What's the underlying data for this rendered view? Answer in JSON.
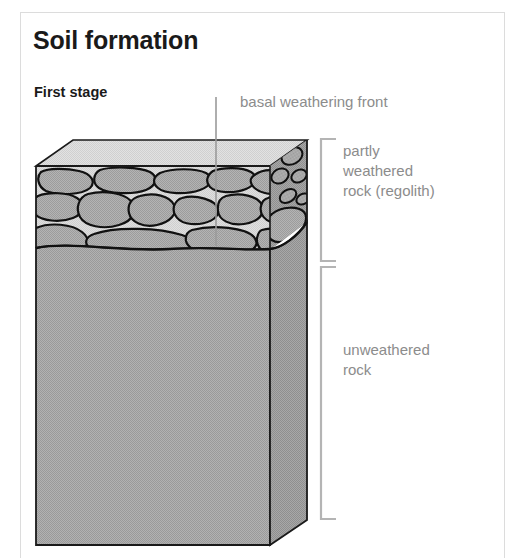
{
  "figure": {
    "title": "Soil formation",
    "subtitle": "First stage",
    "background_color": "#ffffff",
    "border_color": "#dcdcdc"
  },
  "labels": {
    "basal_weathering_front": "basal weathering front",
    "partly_weathered_rock": "partly\nweathered\nrock (regolith)",
    "unweathered_rock": "unweathered\nrock",
    "label_color": "#8c8c8c"
  },
  "diagram": {
    "type": "block-diagram",
    "layers": [
      {
        "name": "partly weathered rock (regolith)",
        "position": "top",
        "fill": "#d4d4d4",
        "fragment_fill": "#a8a8a8",
        "bracket_span_px": [
          138,
          262
        ]
      },
      {
        "name": "unweathered rock",
        "position": "bottom",
        "fill": "#a8a8a8",
        "bracket_span_px": [
          266,
          520
        ]
      }
    ],
    "colors": {
      "top_face": "#dadada",
      "front_face_regolith_matrix": "#d6d6d6",
      "rock_fragment": "#a9a9a9",
      "bedrock_front": "#a8a8a8",
      "bedrock_side": "#9c9c9c",
      "outline": "#1a1a1a",
      "bracket": "#b4b4b4",
      "leader_line": "#9a9a9a"
    },
    "leader_line": {
      "from_label": "basal weathering front",
      "x": 216,
      "y_top": 97,
      "y_bottom": 246
    }
  }
}
